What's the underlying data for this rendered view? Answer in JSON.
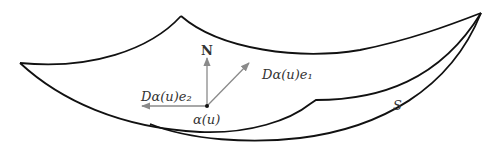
{
  "figure": {
    "surface_label": "S",
    "point_label": "α(u)",
    "normal_label": "N",
    "tangent1_label": "Dα(u)e₁",
    "tangent2_label": "Dα(u)e₂"
  },
  "colors": {
    "surface_edge": "#111111",
    "vectors": "#8a8a8a",
    "text": "#333333"
  }
}
